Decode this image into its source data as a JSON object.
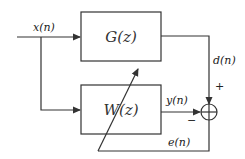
{
  "diagram": {
    "type": "adaptive-filter-system-identification",
    "signals": {
      "input": "x(n)",
      "desired": "d(n)",
      "output": "y(n)",
      "error": "e(n)"
    },
    "blocks": {
      "plant": "G(z)",
      "adaptive_filter": "W(z)"
    },
    "summing_junction": {
      "plus_sign": "+",
      "minus_sign": "−"
    },
    "colors": {
      "stroke": "#333333",
      "background": "#ffffff"
    }
  }
}
